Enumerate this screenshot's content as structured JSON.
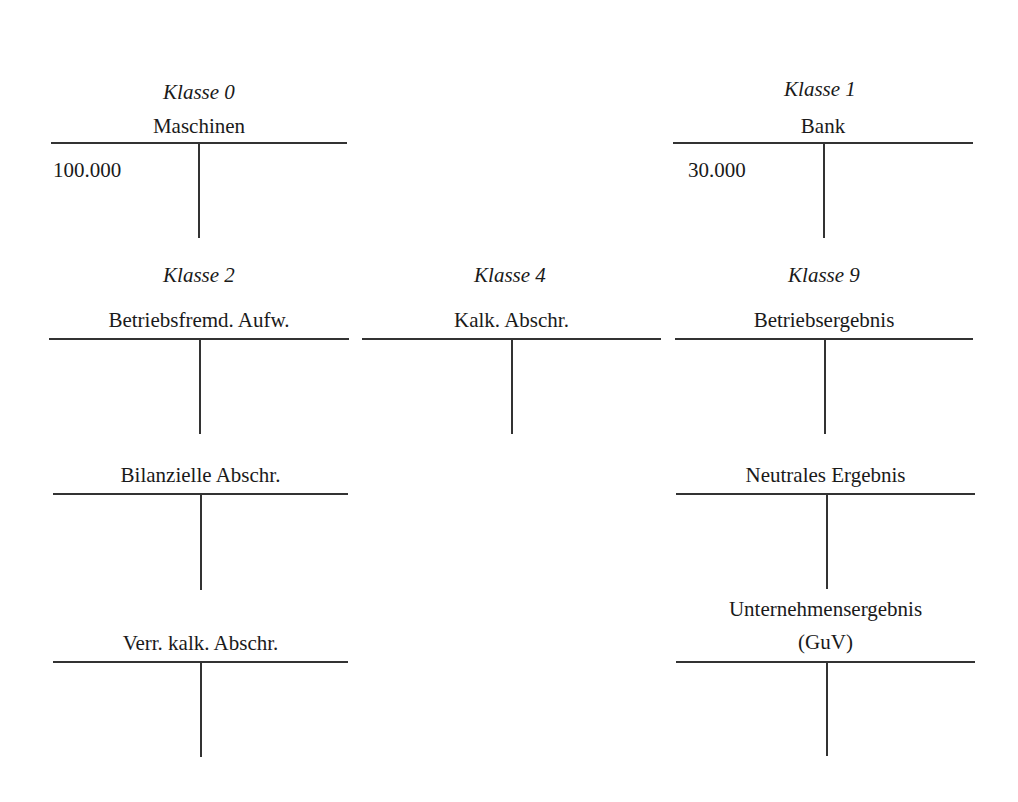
{
  "diagram": {
    "type": "t-accounts",
    "line_color": "#333333",
    "classes": [
      {
        "label": "Klasse 0"
      },
      {
        "label": "Klasse 1"
      },
      {
        "label": "Klasse 2"
      },
      {
        "label": "Klasse 4"
      },
      {
        "label": "Klasse 9"
      }
    ],
    "accounts": {
      "maschinen": {
        "class": "Klasse 0",
        "title": "Maschinen",
        "debit": "100.000",
        "credit": ""
      },
      "bank": {
        "class": "Klasse 1",
        "title": "Bank",
        "debit": "30.000",
        "credit": ""
      },
      "betriebsfremd": {
        "class": "Klasse 2",
        "title": "Betriebsfremd. Aufw.",
        "debit": "",
        "credit": ""
      },
      "bilanzielle": {
        "class": "Klasse 2",
        "title": "Bilanzielle Abschr.",
        "debit": "",
        "credit": ""
      },
      "verr_kalk": {
        "class": "Klasse 2",
        "title": "Verr. kalk. Abschr.",
        "debit": "",
        "credit": ""
      },
      "kalk_abschr": {
        "class": "Klasse 4",
        "title": "Kalk. Abschr.",
        "debit": "",
        "credit": ""
      },
      "betriebsergebnis": {
        "class": "Klasse 9",
        "title": "Betriebsergebnis",
        "debit": "",
        "credit": ""
      },
      "neutrales": {
        "class": "Klasse 9",
        "title": "Neutrales Ergebnis",
        "debit": "",
        "credit": ""
      },
      "unternehmen": {
        "class": "Klasse 9",
        "title_line1": "Unternehmensergebnis",
        "title_line2": "(GuV)",
        "debit": "",
        "credit": ""
      }
    }
  }
}
